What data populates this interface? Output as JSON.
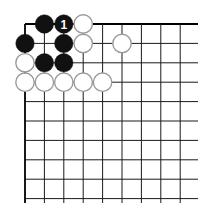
{
  "diagram": {
    "type": "go-board-corner",
    "grid": {
      "origin_x": 25,
      "origin_y": 24,
      "spacing": 19.4,
      "columns": 10,
      "rows": 10,
      "line_color": "#1a1a1a",
      "edge_color": "#000000"
    },
    "stones": [
      {
        "col": 1,
        "row": 0,
        "color": "black"
      },
      {
        "col": 2,
        "row": 0,
        "color": "black",
        "label": "1"
      },
      {
        "col": 3,
        "row": 0,
        "color": "white"
      },
      {
        "col": 0,
        "row": 1,
        "color": "black"
      },
      {
        "col": 2,
        "row": 1,
        "color": "black"
      },
      {
        "col": 3,
        "row": 1,
        "color": "white"
      },
      {
        "col": 5,
        "row": 1,
        "color": "white"
      },
      {
        "col": 0,
        "row": 2,
        "color": "white"
      },
      {
        "col": 1,
        "row": 2,
        "color": "black"
      },
      {
        "col": 2,
        "row": 2,
        "color": "black"
      },
      {
        "col": 0,
        "row": 3,
        "color": "white"
      },
      {
        "col": 1,
        "row": 3,
        "color": "white"
      },
      {
        "col": 2,
        "row": 3,
        "color": "white"
      },
      {
        "col": 3,
        "row": 3,
        "color": "white"
      },
      {
        "col": 4,
        "row": 3,
        "color": "white"
      }
    ],
    "colors": {
      "black_stone": "#111111",
      "white_stone_fill": "#ffffff",
      "white_stone_stroke": "#9a9a9a",
      "label_on_black": "#ffffff"
    }
  }
}
